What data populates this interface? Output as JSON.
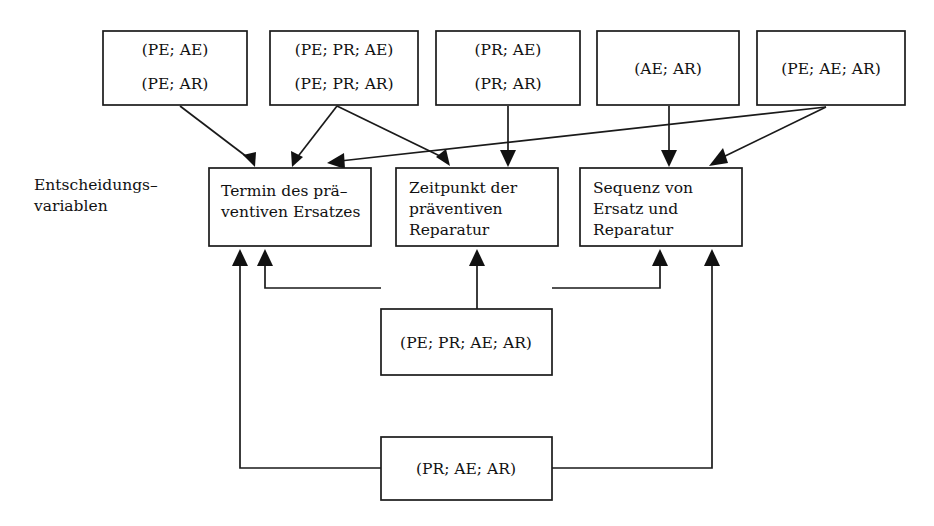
{
  "figure": {
    "title": "",
    "side_label_line1": "Entscheidungs–",
    "side_label_line2": "variablen"
  },
  "top_boxes": [
    {
      "id": "tb1",
      "line1": "(PE; AE)",
      "line2": "(PE; AR)",
      "x": 103,
      "y": 31,
      "w": 144,
      "h": 74
    },
    {
      "id": "tb2",
      "line1": "(PE; PR; AE)",
      "line2": "(PE; PR; AR)",
      "x": 270,
      "y": 31,
      "w": 148,
      "h": 74
    },
    {
      "id": "tb3",
      "line1": "(PR; AE)",
      "line2": "(PR; AR)",
      "x": 436,
      "y": 31,
      "w": 144,
      "h": 74
    },
    {
      "id": "tb4",
      "line1": "(AE; AR)",
      "line2": "",
      "x": 597,
      "y": 31,
      "w": 142,
      "h": 74
    },
    {
      "id": "tb5",
      "line1": "(PE; AE; AR)",
      "line2": "",
      "x": 757,
      "y": 31,
      "w": 148,
      "h": 74
    }
  ],
  "decision_boxes": [
    {
      "id": "db1",
      "lines": [
        "Termin des prä–",
        "ventiven Ersatzes"
      ],
      "x": 209,
      "y": 168,
      "w": 162,
      "h": 78
    },
    {
      "id": "db2",
      "lines": [
        "Zeitpunkt der",
        "präventiven",
        "Reparatur"
      ],
      "x": 396,
      "y": 168,
      "w": 162,
      "h": 78
    },
    {
      "id": "db3",
      "lines": [
        "Sequenz von",
        "Ersatz und",
        "Reparatur"
      ],
      "x": 580,
      "y": 168,
      "w": 162,
      "h": 78
    }
  ],
  "bottom_boxes": [
    {
      "id": "bb1",
      "label": "(PE; PR; AE; AR)",
      "x": 381,
      "y": 309,
      "w": 171,
      "h": 66
    },
    {
      "id": "bb2",
      "label": "(PR; AE; AR)",
      "x": 381,
      "y": 437,
      "w": 171,
      "h": 63
    }
  ],
  "edges": [
    {
      "from": "tb1",
      "to": "db1",
      "kind": "diagonal"
    },
    {
      "from": "tb2",
      "to": "db1",
      "kind": "diagonal"
    },
    {
      "from": "tb2",
      "to": "db2",
      "kind": "diagonal"
    },
    {
      "from": "tb3",
      "to": "db2",
      "kind": "vertical"
    },
    {
      "from": "tb4",
      "to": "db3",
      "kind": "vertical"
    },
    {
      "from": "tb5",
      "to": "db1",
      "kind": "long-diagonal"
    },
    {
      "from": "tb5",
      "to": "db3",
      "kind": "diagonal"
    },
    {
      "from": "bb1",
      "to": "db2",
      "kind": "vertical"
    },
    {
      "from": "bb1",
      "to": "db1",
      "kind": "elbow"
    },
    {
      "from": "bb1",
      "to": "db3",
      "kind": "elbow"
    },
    {
      "from": "bb2",
      "to": "db1",
      "kind": "elbow-long"
    },
    {
      "from": "bb2",
      "to": "db3",
      "kind": "elbow-long"
    }
  ],
  "colors": {
    "stroke": "#1a1a1a",
    "fill": "#ffffff",
    "text": "#111111"
  }
}
